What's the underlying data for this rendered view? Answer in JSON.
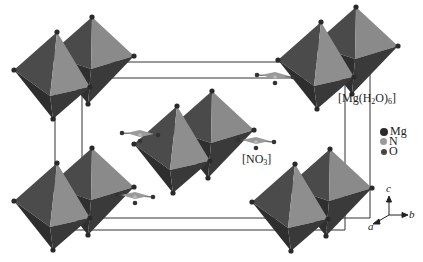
{
  "figure": {
    "type": "crystal-structure",
    "labels": {
      "octahedron_prefix": "[Mg(H",
      "octahedron_sub1": "2",
      "octahedron_mid": "O)",
      "octahedron_sub2": "6",
      "octahedron_suffix": "]",
      "nitrate_prefix": "[NO",
      "nitrate_sub": "3",
      "nitrate_suffix": "]"
    },
    "legend": [
      {
        "label": "Mg",
        "color": "#2a2a2a"
      },
      {
        "label": "N",
        "color": "#9a9a9a"
      },
      {
        "label": "O",
        "color": "#444444"
      }
    ],
    "axes": {
      "a": "a",
      "b": "b",
      "c": "c"
    },
    "colors": {
      "face_light": "#8a8a8a",
      "face_mid": "#6e6e6e",
      "face_dark": "#3c3c3c",
      "face_darkest": "#2a2a2a",
      "cell_line": "#333333"
    }
  }
}
